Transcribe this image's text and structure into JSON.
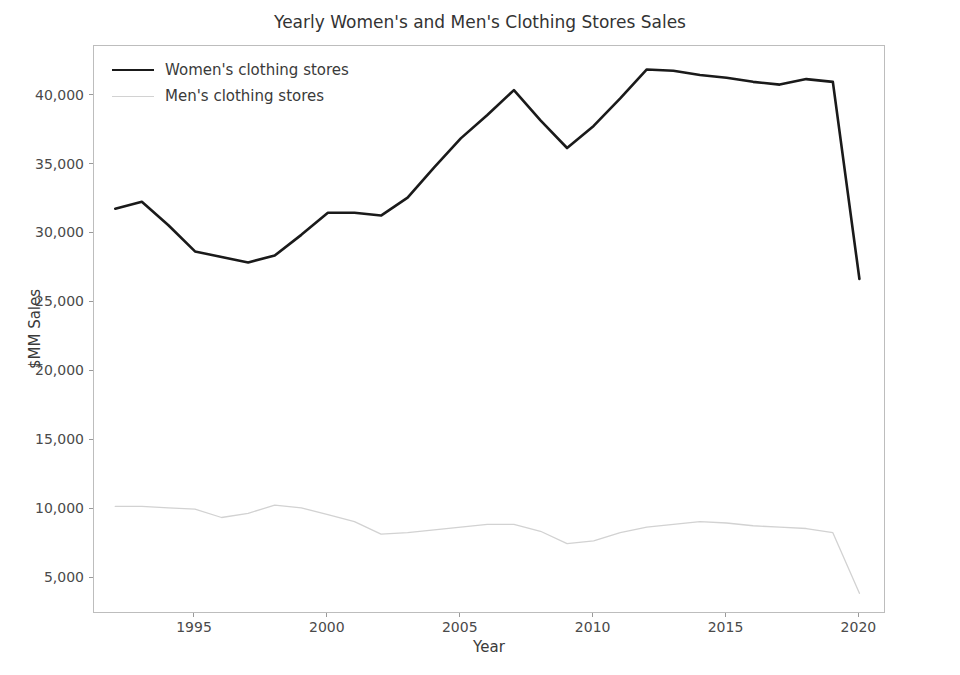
{
  "chart_data": {
    "type": "line",
    "title": "Yearly Women's and Men's Clothing Stores Sales",
    "xlabel": "Year",
    "ylabel": "$MM Sales",
    "grid": false,
    "legend_position": "upper left",
    "xlim": [
      1991.2,
      2021.0
    ],
    "ylim": [
      2400,
      43600
    ],
    "x": [
      1992,
      1993,
      1994,
      1995,
      1996,
      1997,
      1998,
      1999,
      2000,
      2001,
      2002,
      2003,
      2004,
      2005,
      2006,
      2007,
      2008,
      2009,
      2010,
      2011,
      2012,
      2013,
      2014,
      2015,
      2016,
      2017,
      2018,
      2019,
      2020
    ],
    "xticks": [
      1995,
      2000,
      2005,
      2010,
      2015,
      2020
    ],
    "xticklabels": [
      "1995",
      "2000",
      "2005",
      "2010",
      "2015",
      "2020"
    ],
    "yticks": [
      5000,
      10000,
      15000,
      20000,
      25000,
      30000,
      35000,
      40000
    ],
    "yticklabels": [
      "5,000",
      "10,000",
      "15,000",
      "20,000",
      "25,000",
      "30,000",
      "35,000",
      "40,000"
    ],
    "series": [
      {
        "name": "Women's clothing stores",
        "color": "#1a1a1a",
        "linewidth": 2.6,
        "values": [
          31800,
          32300,
          30600,
          28700,
          28300,
          27900,
          28400,
          29900,
          31500,
          31500,
          31300,
          32600,
          34800,
          36900,
          38600,
          40400,
          38200,
          36200,
          37800,
          39800,
          41900,
          41800,
          41500,
          41300,
          41000,
          40800,
          41200,
          41000,
          26700
        ]
      },
      {
        "name": "Men's clothing stores",
        "color": "#d2d2d2",
        "linewidth": 1.3,
        "values": [
          10200,
          10200,
          10100,
          10000,
          9400,
          9700,
          10300,
          10100,
          9600,
          9100,
          8200,
          8300,
          8500,
          8700,
          8900,
          8900,
          8400,
          7500,
          7700,
          8300,
          8700,
          8900,
          9100,
          9000,
          8800,
          8700,
          8600,
          8300,
          3900
        ]
      }
    ]
  },
  "figure": {
    "background_color": "#ffffff",
    "axes_border_color": "#bdbdbd",
    "tick_color": "#9a9a9a",
    "text_color": "#3a3a3a"
  }
}
